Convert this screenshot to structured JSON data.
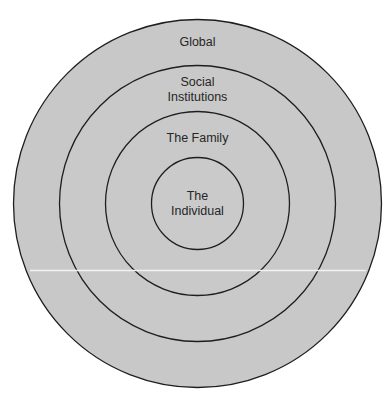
{
  "diagram": {
    "type": "concentric-circles",
    "center": {
      "x": 197.5,
      "y": 203.5
    },
    "fill_color": "#c8c8c8",
    "stroke_color": "#1e1e1e",
    "background_color": "#ffffff",
    "rings": [
      {
        "level": 4,
        "name": "global",
        "radius": 184,
        "lines": [
          "Global"
        ],
        "label_y": [
          46
        ]
      },
      {
        "level": 3,
        "name": "social-institutions",
        "radius": 138,
        "lines": [
          "Social",
          "Institutions"
        ],
        "label_y": [
          86,
          101
        ]
      },
      {
        "level": 2,
        "name": "the-family",
        "radius": 92,
        "lines": [
          "The Family"
        ],
        "label_y": [
          142
        ]
      },
      {
        "level": 1,
        "name": "the-individual",
        "radius": 46,
        "lines": [
          "The",
          "Individual"
        ],
        "label_y": [
          200,
          215
        ]
      }
    ]
  },
  "labels": {
    "global": "Global",
    "social_line1": "Social",
    "social_line2": "Institutions",
    "family": "The Family",
    "individual_line1": "The",
    "individual_line2": "Individual"
  }
}
